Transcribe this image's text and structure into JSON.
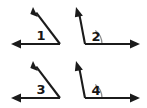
{
  "figure": {
    "background_color": "#ffffff",
    "stroke_color": "#1b1b1b",
    "arc_color": "#8d8d8d",
    "label_color": "#161616",
    "width": 147,
    "height": 108
  },
  "angles": [
    {
      "id": "angle-1",
      "label": "1",
      "label_x": 41,
      "label_y": 36,
      "type": "acute",
      "has_arc": false,
      "vertex": {
        "x": 60,
        "y": 44
      },
      "rays": [
        {
          "name": "horizontal-left-ray",
          "to_x": 11,
          "to_y": 44,
          "arrow": "left"
        },
        {
          "name": "upper-left-ray",
          "to_x": 33,
          "to_y": 7,
          "arrow": "up-left"
        }
      ]
    },
    {
      "id": "angle-2",
      "label": "2",
      "label_x": 96,
      "label_y": 37,
      "type": "obtuse",
      "has_arc": true,
      "arc_radius": 17,
      "vertex": {
        "x": 85,
        "y": 44
      },
      "rays": [
        {
          "name": "horizontal-right-ray",
          "to_x": 140,
          "to_y": 44,
          "arrow": "right"
        },
        {
          "name": "upper-left-ray",
          "to_x": 76,
          "to_y": 7,
          "arrow": "up-left"
        }
      ]
    },
    {
      "id": "angle-3",
      "label": "3",
      "label_x": 41,
      "label_y": 90,
      "type": "acute",
      "has_arc": false,
      "vertex": {
        "x": 60,
        "y": 98
      },
      "rays": [
        {
          "name": "horizontal-left-ray",
          "to_x": 11,
          "to_y": 98,
          "arrow": "left"
        },
        {
          "name": "upper-left-ray",
          "to_x": 33,
          "to_y": 61,
          "arrow": "up-left"
        }
      ]
    },
    {
      "id": "angle-4",
      "label": "4",
      "label_x": 96,
      "label_y": 91,
      "type": "obtuse",
      "has_arc": true,
      "arc_radius": 17,
      "vertex": {
        "x": 85,
        "y": 98
      },
      "rays": [
        {
          "name": "horizontal-right-ray",
          "to_x": 140,
          "to_y": 98,
          "arrow": "right"
        },
        {
          "name": "upper-left-ray",
          "to_x": 76,
          "to_y": 61,
          "arrow": "up-left"
        }
      ]
    }
  ]
}
